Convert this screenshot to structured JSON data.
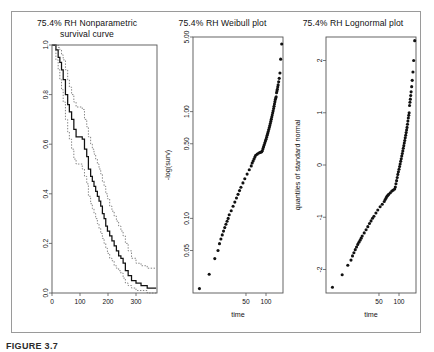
{
  "figure": {
    "caption": "FIGURE 3.7",
    "border_color": "#9a9a9a",
    "background": "#ffffff"
  },
  "chart_data": [
    {
      "type": "line",
      "id": "nonparametric-survival-curve",
      "title": "75.4% RH Nonparametric survival curve",
      "title_line1": "75.4% RH Nonparametric",
      "title_line2": "survival curve",
      "xlabel": "",
      "ylabel": "",
      "xlim": [
        0,
        375
      ],
      "ylim": [
        0.0,
        1.0
      ],
      "xticks": [
        0,
        100,
        200,
        300
      ],
      "xticklabels": [
        "0",
        "100",
        "200",
        "300"
      ],
      "yticks": [
        0.0,
        0.2,
        0.4,
        0.6,
        0.8,
        1.0
      ],
      "yticklabels": [
        "0.0",
        "0.2",
        "0.4",
        "0.6",
        "0.8",
        "1.0"
      ],
      "grid": false,
      "legend": "none",
      "series": [
        {
          "name": "Kaplan-Meier estimate",
          "style": "solid-step",
          "color": "#111111",
          "x": [
            0,
            14,
            22,
            28,
            34,
            40,
            48,
            56,
            62,
            70,
            78,
            86,
            94,
            100,
            108,
            116,
            124,
            130,
            138,
            144,
            150,
            156,
            162,
            168,
            174,
            180,
            186,
            192,
            198,
            206,
            214,
            222,
            230,
            238,
            246,
            254,
            262,
            272,
            284,
            300,
            318,
            340,
            360,
            372
          ],
          "y": [
            1.0,
            0.98,
            0.95,
            0.93,
            0.9,
            0.86,
            0.8,
            0.76,
            0.73,
            0.7,
            0.66,
            0.63,
            0.63,
            0.63,
            0.62,
            0.58,
            0.55,
            0.5,
            0.47,
            0.45,
            0.43,
            0.41,
            0.39,
            0.37,
            0.35,
            0.32,
            0.3,
            0.27,
            0.25,
            0.23,
            0.21,
            0.19,
            0.17,
            0.15,
            0.14,
            0.12,
            0.09,
            0.07,
            0.05,
            0.04,
            0.03,
            0.02,
            0.02,
            0.02
          ]
        },
        {
          "name": "upper confidence limit",
          "style": "dotted",
          "color": "#6d6d6d",
          "x": [
            0,
            14,
            22,
            28,
            34,
            40,
            48,
            56,
            62,
            70,
            78,
            86,
            94,
            100,
            108,
            116,
            124,
            130,
            138,
            144,
            150,
            156,
            162,
            168,
            174,
            180,
            186,
            192,
            198,
            206,
            214,
            222,
            230,
            238,
            246,
            254,
            262,
            272,
            284,
            300,
            318,
            340,
            360,
            372
          ],
          "y": [
            1.0,
            1.0,
            0.99,
            0.98,
            0.96,
            0.94,
            0.9,
            0.86,
            0.83,
            0.8,
            0.77,
            0.75,
            0.75,
            0.75,
            0.74,
            0.7,
            0.67,
            0.63,
            0.6,
            0.58,
            0.56,
            0.54,
            0.52,
            0.5,
            0.48,
            0.45,
            0.43,
            0.4,
            0.38,
            0.35,
            0.33,
            0.31,
            0.29,
            0.27,
            0.25,
            0.23,
            0.2,
            0.17,
            0.14,
            0.12,
            0.11,
            0.1,
            0.1,
            0.1
          ]
        },
        {
          "name": "lower confidence limit",
          "style": "dotted",
          "color": "#6d6d6d",
          "x": [
            0,
            14,
            22,
            28,
            34,
            40,
            48,
            56,
            62,
            70,
            78,
            86,
            94,
            100,
            108,
            116,
            124,
            130,
            138,
            144,
            150,
            156,
            162,
            168,
            174,
            180,
            186,
            192,
            198,
            206,
            214,
            222,
            230,
            238,
            246,
            254,
            262,
            272,
            284,
            300,
            318,
            340,
            360,
            372
          ],
          "y": [
            1.0,
            0.94,
            0.9,
            0.86,
            0.82,
            0.77,
            0.7,
            0.65,
            0.62,
            0.58,
            0.54,
            0.52,
            0.52,
            0.52,
            0.5,
            0.47,
            0.44,
            0.39,
            0.36,
            0.34,
            0.32,
            0.3,
            0.28,
            0.26,
            0.24,
            0.22,
            0.2,
            0.18,
            0.16,
            0.14,
            0.13,
            0.11,
            0.1,
            0.09,
            0.08,
            0.06,
            0.04,
            0.03,
            0.02,
            0.01,
            0.01,
            0.0,
            0.0,
            0.0
          ]
        }
      ]
    },
    {
      "type": "scatter",
      "id": "weibull-plot",
      "title": "75.4% RH Weibull plot",
      "xlabel": "time",
      "ylabel": "-log(surv)",
      "x_scale": "log",
      "y_scale": "log",
      "xlim": [
        8,
        180
      ],
      "ylim": [
        0.02,
        5.0
      ],
      "xticks": [
        50,
        100
      ],
      "xticklabels": [
        "50",
        "100"
      ],
      "yticks": [
        0.05,
        0.1,
        0.5,
        1.0,
        5.0
      ],
      "yticklabels": [
        "0.05",
        "0.10",
        "0.50",
        "1.00",
        "5.00"
      ],
      "grid": false,
      "legend": "none",
      "marker": "filled-circle",
      "color": "#111111",
      "points_x": [
        10,
        14,
        17,
        19,
        20,
        21,
        22,
        23,
        24,
        25,
        26,
        27,
        28,
        30,
        32,
        34,
        36,
        38,
        40,
        42,
        45,
        48,
        52,
        56,
        60,
        62,
        64,
        66,
        68,
        70,
        74,
        78,
        82,
        86,
        88,
        90,
        92,
        94,
        96,
        98,
        100,
        102,
        104,
        106,
        108,
        110,
        112,
        114,
        116,
        118,
        120,
        122,
        124,
        126,
        128,
        130,
        132,
        134,
        136,
        138,
        140,
        142,
        144,
        146,
        148,
        150,
        152,
        155,
        158,
        162,
        166,
        172
      ],
      "points_y": [
        0.022,
        0.03,
        0.042,
        0.05,
        0.058,
        0.064,
        0.07,
        0.076,
        0.082,
        0.088,
        0.094,
        0.1,
        0.108,
        0.118,
        0.13,
        0.142,
        0.155,
        0.168,
        0.182,
        0.196,
        0.215,
        0.235,
        0.26,
        0.285,
        0.31,
        0.33,
        0.345,
        0.36,
        0.375,
        0.39,
        0.4,
        0.41,
        0.415,
        0.42,
        0.43,
        0.45,
        0.47,
        0.49,
        0.51,
        0.53,
        0.55,
        0.575,
        0.6,
        0.625,
        0.65,
        0.68,
        0.71,
        0.74,
        0.775,
        0.81,
        0.85,
        0.89,
        0.93,
        0.975,
        1.02,
        1.07,
        1.12,
        1.18,
        1.24,
        1.3,
        1.34,
        1.38,
        1.5,
        1.56,
        1.62,
        1.7,
        1.78,
        1.9,
        2.05,
        2.3,
        3.1,
        4.3
      ]
    },
    {
      "type": "scatter",
      "id": "lognormal-plot",
      "title": "75.4% RH Lognormal plot",
      "xlabel": "time",
      "ylabel": "quantiles of standard normal",
      "x_scale": "log",
      "y_scale": "linear",
      "xlim": [
        8,
        180
      ],
      "ylim": [
        -2.45,
        2.45
      ],
      "xticks": [
        50,
        100
      ],
      "xticklabels": [
        "50",
        "100"
      ],
      "yticks": [
        -2,
        -1,
        0,
        1,
        2
      ],
      "yticklabels": [
        "-2",
        "-1",
        "0",
        "1",
        "2"
      ],
      "grid": false,
      "legend": "none",
      "marker": "filled-circle",
      "color": "#111111",
      "points_x": [
        10,
        14,
        17,
        19,
        20,
        21,
        22,
        23,
        24,
        25,
        26,
        27,
        28,
        30,
        32,
        34,
        36,
        38,
        40,
        42,
        45,
        48,
        52,
        56,
        60,
        62,
        64,
        66,
        68,
        70,
        74,
        78,
        82,
        86,
        88,
        90,
        92,
        94,
        96,
        98,
        100,
        102,
        104,
        106,
        108,
        110,
        112,
        114,
        116,
        118,
        120,
        122,
        124,
        126,
        128,
        130,
        132,
        134,
        136,
        138,
        140,
        142,
        144,
        146,
        148,
        150,
        152,
        155,
        158,
        162,
        166,
        172
      ],
      "points_y": [
        -2.34,
        -2.1,
        -1.92,
        -1.82,
        -1.74,
        -1.68,
        -1.62,
        -1.57,
        -1.52,
        -1.48,
        -1.44,
        -1.4,
        -1.36,
        -1.3,
        -1.24,
        -1.18,
        -1.12,
        -1.07,
        -1.02,
        -0.98,
        -0.92,
        -0.86,
        -0.8,
        -0.75,
        -0.7,
        -0.66,
        -0.63,
        -0.6,
        -0.58,
        -0.56,
        -0.53,
        -0.5,
        -0.48,
        -0.46,
        -0.42,
        -0.36,
        -0.3,
        -0.24,
        -0.18,
        -0.13,
        -0.08,
        -0.03,
        0.02,
        0.07,
        0.12,
        0.17,
        0.22,
        0.27,
        0.32,
        0.37,
        0.42,
        0.47,
        0.52,
        0.57,
        0.62,
        0.67,
        0.72,
        0.78,
        0.84,
        0.9,
        0.95,
        1.0,
        1.14,
        1.2,
        1.26,
        1.33,
        1.4,
        1.5,
        1.62,
        1.78,
        2.0,
        2.38
      ]
    }
  ]
}
